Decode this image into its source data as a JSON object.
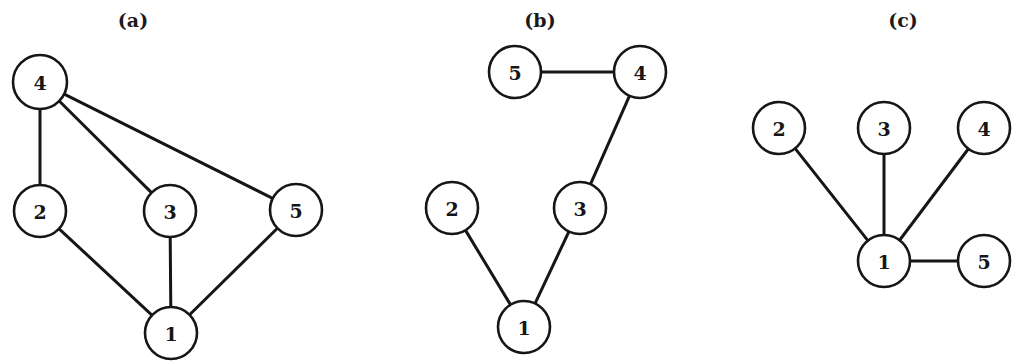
{
  "figure": {
    "background_color": "#ffffff",
    "ink_color": "#161616",
    "node_fill": "#ffffff",
    "node_radius": 26,
    "edge_width": 3,
    "node_stroke_width": 2.6
  },
  "chart_data": {
    "type": "diagram",
    "diagram_kind": "undirected-graph-panels",
    "title": "",
    "panels": [
      {
        "caption": "(a)",
        "caption_pos": {
          "x": 133,
          "y": 20
        },
        "nodes": [
          {
            "id": "4",
            "label": "4",
            "x": 40,
            "y": 82,
            "r": 27
          },
          {
            "id": "2",
            "label": "2",
            "x": 40,
            "y": 211,
            "r": 26
          },
          {
            "id": "3",
            "label": "3",
            "x": 170,
            "y": 211,
            "r": 26
          },
          {
            "id": "5",
            "label": "5",
            "x": 296,
            "y": 210,
            "r": 26
          },
          {
            "id": "1",
            "label": "1",
            "x": 171,
            "y": 333,
            "r": 26
          }
        ],
        "edges": [
          {
            "from": "4",
            "to": "2"
          },
          {
            "from": "4",
            "to": "3"
          },
          {
            "from": "4",
            "to": "5"
          },
          {
            "from": "2",
            "to": "1"
          },
          {
            "from": "3",
            "to": "1"
          },
          {
            "from": "5",
            "to": "1"
          }
        ]
      },
      {
        "caption": "(b)",
        "caption_pos": {
          "x": 540,
          "y": 20
        },
        "nodes": [
          {
            "id": "5",
            "label": "5",
            "x": 515,
            "y": 72,
            "r": 26
          },
          {
            "id": "4",
            "label": "4",
            "x": 640,
            "y": 72,
            "r": 26
          },
          {
            "id": "2",
            "label": "2",
            "x": 452,
            "y": 208,
            "r": 26
          },
          {
            "id": "3",
            "label": "3",
            "x": 580,
            "y": 208,
            "r": 26
          },
          {
            "id": "1",
            "label": "1",
            "x": 524,
            "y": 327,
            "r": 26
          }
        ],
        "edges": [
          {
            "from": "5",
            "to": "4"
          },
          {
            "from": "4",
            "to": "3"
          },
          {
            "from": "3",
            "to": "1"
          },
          {
            "from": "2",
            "to": "1"
          }
        ]
      },
      {
        "caption": "(c)",
        "caption_pos": {
          "x": 903,
          "y": 20
        },
        "nodes": [
          {
            "id": "2",
            "label": "2",
            "x": 779,
            "y": 128,
            "r": 26
          },
          {
            "id": "3",
            "label": "3",
            "x": 884,
            "y": 128,
            "r": 26
          },
          {
            "id": "4",
            "label": "4",
            "x": 984,
            "y": 128,
            "r": 26
          },
          {
            "id": "1",
            "label": "1",
            "x": 884,
            "y": 261,
            "r": 26
          },
          {
            "id": "5",
            "label": "5",
            "x": 984,
            "y": 261,
            "r": 26
          }
        ],
        "edges": [
          {
            "from": "1",
            "to": "2"
          },
          {
            "from": "1",
            "to": "3"
          },
          {
            "from": "1",
            "to": "4"
          },
          {
            "from": "1",
            "to": "5"
          }
        ]
      }
    ]
  }
}
